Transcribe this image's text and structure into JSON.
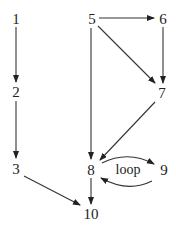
{
  "diagram": {
    "nodes": [
      {
        "id": "1",
        "label": "1"
      },
      {
        "id": "2",
        "label": "2"
      },
      {
        "id": "3",
        "label": "3"
      },
      {
        "id": "5",
        "label": "5"
      },
      {
        "id": "6",
        "label": "6"
      },
      {
        "id": "7",
        "label": "7"
      },
      {
        "id": "8",
        "label": "8"
      },
      {
        "id": "9",
        "label": "9"
      },
      {
        "id": "10",
        "label": "10"
      }
    ],
    "edges": [
      {
        "from": "1",
        "to": "2"
      },
      {
        "from": "2",
        "to": "3"
      },
      {
        "from": "3",
        "to": "10"
      },
      {
        "from": "5",
        "to": "6"
      },
      {
        "from": "5",
        "to": "7"
      },
      {
        "from": "5",
        "to": "8"
      },
      {
        "from": "6",
        "to": "7"
      },
      {
        "from": "7",
        "to": "8"
      },
      {
        "from": "8",
        "to": "9",
        "label": "loop"
      },
      {
        "from": "9",
        "to": "8"
      },
      {
        "from": "8",
        "to": "10"
      }
    ],
    "loop_label": "loop"
  }
}
